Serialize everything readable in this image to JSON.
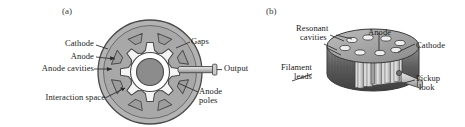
{
  "figure": {
    "background_color": "#ffffff",
    "body_fill": "#a8a8a8",
    "cavity_fill": "#f4f4f4",
    "cathode_fill": "#8c8c8c",
    "interaction_fill": "#ffffff",
    "outline_color": "#4a4a4a",
    "label_color": "#1a1a1a"
  },
  "panels": [
    {
      "id": "panel-a",
      "caption": "(a)",
      "view": "cross-section",
      "cavity_count": 8,
      "labels": [
        {
          "name": "cathode",
          "text": "Cathode"
        },
        {
          "name": "anode",
          "text": "Anode"
        },
        {
          "name": "anode-cavities",
          "text": "Anode cavities"
        },
        {
          "name": "interaction-space",
          "text": "Interaction space"
        },
        {
          "name": "gaps",
          "text": "Gaps"
        },
        {
          "name": "output",
          "text": "Output"
        },
        {
          "name": "anode-poles-1",
          "text": "Anode"
        },
        {
          "name": "anode-poles-2",
          "text": "poles"
        }
      ]
    },
    {
      "id": "panel-b",
      "caption": "(b)",
      "view": "cutaway-perspective",
      "labels": [
        {
          "name": "resonant-cavities-1",
          "text": "Resonant"
        },
        {
          "name": "resonant-cavities-2",
          "text": "cavities"
        },
        {
          "name": "anode",
          "text": "Anode"
        },
        {
          "name": "cathode",
          "text": "Cathode"
        },
        {
          "name": "filament-leads-1",
          "text": "Filament"
        },
        {
          "name": "filament-leads-2",
          "text": "leads"
        },
        {
          "name": "pickup-loop-1",
          "text": "Pickup"
        },
        {
          "name": "pickup-loop-2",
          "text": "look"
        }
      ]
    }
  ]
}
